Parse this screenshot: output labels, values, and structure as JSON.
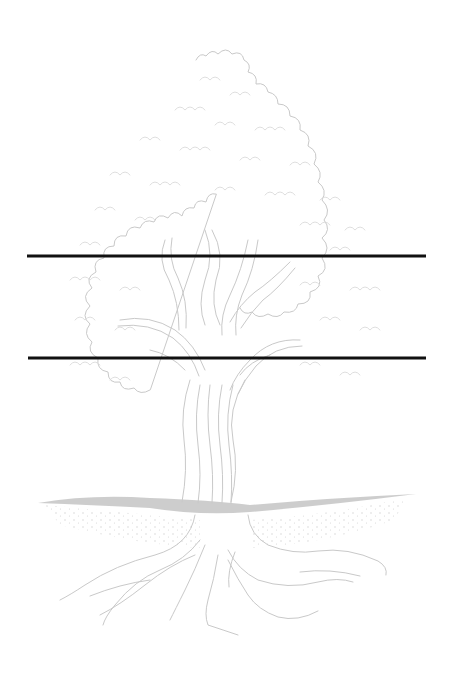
{
  "image": {
    "description": "Pencil sketch of a broad-canopied tree with trunk, ground line and spreading roots, crossed by two horizontal black lines",
    "subject": "tree",
    "colors": {
      "background": "#ffffff",
      "sketch_stroke": "#c9c9c9",
      "ground_band": "#c8c8c8",
      "lines": "#111111"
    }
  },
  "overlay_lines": [
    {
      "id": "upper-line",
      "x1": 27,
      "x2": 426,
      "y": 256
    },
    {
      "id": "lower-line",
      "x1": 28,
      "x2": 426,
      "y": 358
    }
  ]
}
